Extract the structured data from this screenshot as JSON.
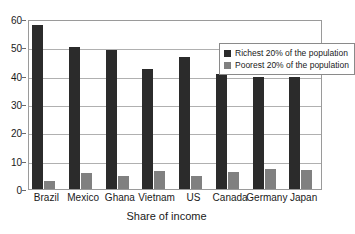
{
  "chart_data": {
    "type": "bar",
    "title": "",
    "subtitle": "",
    "xlabel": "Share of income",
    "ylabel": "",
    "ylim": [
      0,
      60
    ],
    "y_ticks": [
      0,
      10,
      20,
      30,
      40,
      50,
      60
    ],
    "y_tick_labels": [
      "0",
      "10",
      "20",
      "30",
      "40",
      "50",
      "60"
    ],
    "grid": true,
    "legend_position": "top-right",
    "categories": [
      "Brazil",
      "Mexico",
      "Ghana",
      "Vietnam",
      "US",
      "Canada",
      "Germany",
      "Japan"
    ],
    "series": [
      {
        "name": "Richest 20% of the population",
        "color": "#2b2b2b",
        "values": [
          58,
          50,
          49,
          42.5,
          46.5,
          40.5,
          39.5,
          39.5
        ]
      },
      {
        "name": "Poorest 20% of the population",
        "color": "#808080",
        "values": [
          3,
          5.5,
          4.7,
          6.5,
          4.6,
          6.1,
          7.2,
          6.6
        ]
      }
    ]
  },
  "legend": {
    "items": [
      {
        "label": "Richest 20% of the population"
      },
      {
        "label": "Poorest 20% of the population"
      }
    ]
  },
  "axis": {
    "x_title": "Share of income"
  },
  "colors": {
    "richest": "#2b2b2b",
    "poorest": "#808080",
    "gridline": "#b0b0b0",
    "frame": "#9a9a9a",
    "text": "#1a1a1a",
    "background": "#ffffff"
  }
}
